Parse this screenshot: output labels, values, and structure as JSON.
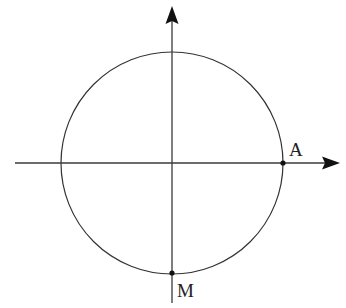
{
  "diagram": {
    "type": "unit-circle",
    "colors": {
      "stroke": "#333333",
      "axis": "#3a3a3a",
      "point": "#111111",
      "background": "#ffffff"
    },
    "origin": {
      "x": 172,
      "y": 163
    },
    "radius": 111,
    "axes": {
      "x": {
        "from": 15,
        "to": 340,
        "arrow": true
      },
      "y": {
        "from": 303,
        "to": 6,
        "arrow": true
      }
    },
    "points": [
      {
        "name": "A",
        "label": "A",
        "x": 283,
        "y": 163,
        "label_x": 289,
        "label_y": 156
      },
      {
        "name": "M",
        "label": "M",
        "x": 172,
        "y": 273,
        "label_x": 177,
        "label_y": 297
      }
    ]
  }
}
